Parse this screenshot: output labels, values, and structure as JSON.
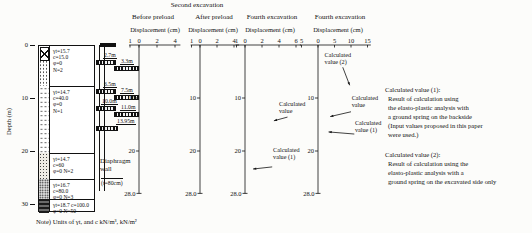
{
  "figure": {
    "group_header": "Second excavation",
    "note": "Note) Units of γt, and c kN/m³, kN/m²"
  },
  "depth_axis": {
    "label": "Depth (m)",
    "ticks": [
      "0",
      "10",
      "20",
      "30"
    ]
  },
  "soil": {
    "layers": [
      {
        "text": "γt=15.7\nc=15.0\nφ=0\nN=2"
      },
      {
        "text": "γt=14.7\nc=40.0\nφ=0\nN=1"
      },
      {
        "text": "γt=14.7\nc=60\nφ=0 N=2"
      },
      {
        "text": "γt=16.7\nc=80.0\nφ=0 N=3"
      },
      {
        "text": "γt=18.7 c=100.0\nφ=0 N=50"
      }
    ]
  },
  "wall": {
    "label": "Diaphragm\nwall",
    "thickness": "(t=80cm)",
    "struts": [
      {
        "label": "2.7m"
      },
      {
        "label": "3.3m"
      },
      {
        "label": "6.5m"
      },
      {
        "label": "7.5m"
      },
      {
        "label": "10.0m"
      },
      {
        "label": "11.0m"
      },
      {
        "label": "13.95m"
      }
    ]
  },
  "legend_notes": [
    {
      "title": "Calculated value (1):",
      "body": "Result of calculation using\nthe elasto-plastic analysis with\na ground spring on the backside\n(Input values proposed in this paper\nwere used.)"
    },
    {
      "title": "Calculated value (2):",
      "body": "Result of calculation using the\nelasto-plastic analysis with a\nground spring on the excavated side only"
    }
  ],
  "chart_data": [
    {
      "type": "line",
      "title": "Before preload",
      "xlabel": "Displacement (cm)",
      "x_ticks": [
        {
          "v": -1,
          "label": "1"
        },
        {
          "v": 0,
          "label": "0"
        },
        {
          "v": 2,
          "label": "2"
        },
        {
          "v": 4,
          "label": "4"
        }
      ],
      "x_range": [
        -1.1,
        4.6
      ],
      "depth_ticks": [
        {
          "v": 10,
          "label": "10"
        },
        {
          "v": 20,
          "label": "20"
        }
      ],
      "depth_max": 28,
      "bottom_label": "28.0",
      "series": [
        {
          "name": "measured",
          "style": "solid",
          "points": [
            [
              0,
              0.7
            ],
            [
              2,
              1.4
            ],
            [
              4,
              2.6
            ],
            [
              6,
              3.8
            ],
            [
              8,
              4.4
            ],
            [
              10,
              4.5
            ],
            [
              12,
              4.1
            ],
            [
              14,
              3.5
            ],
            [
              16,
              2.8
            ],
            [
              18,
              2.0
            ],
            [
              20,
              1.2
            ],
            [
              22,
              0.6
            ],
            [
              24,
              0.25
            ],
            [
              26,
              0.12
            ],
            [
              28,
              0.08
            ]
          ]
        },
        {
          "name": "calculated",
          "style": "dashed",
          "points": [
            [
              0,
              0.15
            ],
            [
              2,
              0.7
            ],
            [
              4,
              1.5
            ],
            [
              6,
              2.3
            ],
            [
              8,
              2.8
            ],
            [
              10,
              3.05
            ],
            [
              12,
              3.05
            ],
            [
              14,
              2.85
            ],
            [
              16,
              2.45
            ],
            [
              18,
              1.9
            ],
            [
              20,
              1.25
            ],
            [
              22,
              0.65
            ],
            [
              24,
              0.3
            ],
            [
              26,
              0.12
            ],
            [
              28,
              0.08
            ]
          ]
        }
      ]
    },
    {
      "type": "line",
      "title": "After preload",
      "xlabel": "Displacement (cm)",
      "x_ticks": [
        {
          "v": -1,
          "label": "1"
        },
        {
          "v": 0,
          "label": "0"
        },
        {
          "v": 2,
          "label": "2"
        },
        {
          "v": 4,
          "label": "4"
        }
      ],
      "x_range": [
        -1.1,
        4.6
      ],
      "depth_ticks": [
        {
          "v": 10,
          "label": "10"
        },
        {
          "v": 20,
          "label": "20"
        }
      ],
      "depth_max": 28,
      "bottom_label": "28.0",
      "series": [
        {
          "name": "measured",
          "style": "solid",
          "points": [
            [
              0,
              0.55
            ],
            [
              2,
              0.9
            ],
            [
              4,
              1.5
            ],
            [
              6,
              2.2
            ],
            [
              8,
              2.9
            ],
            [
              10,
              3.4
            ],
            [
              12,
              3.6
            ],
            [
              14,
              3.5
            ],
            [
              16,
              3.1
            ],
            [
              18,
              2.5
            ],
            [
              20,
              1.7
            ],
            [
              22,
              1.0
            ],
            [
              24,
              0.45
            ],
            [
              26,
              0.15
            ],
            [
              28,
              0.08
            ]
          ]
        },
        {
          "name": "calculated",
          "style": "dashed",
          "points": [
            [
              0,
              0.1
            ],
            [
              2,
              0.6
            ],
            [
              4,
              1.3
            ],
            [
              6,
              2.0
            ],
            [
              8,
              2.7
            ],
            [
              10,
              3.15
            ],
            [
              12,
              3.35
            ],
            [
              14,
              3.3
            ],
            [
              16,
              2.95
            ],
            [
              18,
              2.4
            ],
            [
              20,
              1.65
            ],
            [
              22,
              0.95
            ],
            [
              24,
              0.45
            ],
            [
              26,
              0.15
            ],
            [
              28,
              0.08
            ]
          ]
        }
      ]
    },
    {
      "type": "line",
      "title": "Fourth excavation",
      "xlabel": "Displacement (cm)",
      "x_ticks": [
        {
          "v": -1,
          "label": "1"
        },
        {
          "v": 0,
          "label": "0"
        },
        {
          "v": 2,
          "label": "2"
        },
        {
          "v": 4,
          "label": "4"
        },
        {
          "v": 6,
          "label": "6"
        }
      ],
      "x_range": [
        -1.1,
        6.6
      ],
      "depth_ticks": [
        {
          "v": 10,
          "label": "10"
        },
        {
          "v": 20,
          "label": "20"
        }
      ],
      "depth_max": 28,
      "bottom_label": "28.0",
      "series": [
        {
          "name": "measured",
          "style": "solid",
          "points": [
            [
              0,
              0.6
            ],
            [
              2,
              1.0
            ],
            [
              4,
              1.6
            ],
            [
              6,
              2.4
            ],
            [
              8,
              3.3
            ],
            [
              10,
              4.2
            ],
            [
              12,
              4.8
            ],
            [
              14,
              5.0
            ],
            [
              16,
              4.6
            ],
            [
              18,
              3.8
            ],
            [
              20,
              2.6
            ],
            [
              22,
              1.4
            ],
            [
              24,
              0.5
            ],
            [
              26,
              0.15
            ],
            [
              28,
              0.08
            ]
          ]
        },
        {
          "name": "calculated (1)",
          "style": "dashed",
          "points": [
            [
              0,
              0.1
            ],
            [
              2,
              0.6
            ],
            [
              4,
              1.2
            ],
            [
              6,
              1.9
            ],
            [
              8,
              2.6
            ],
            [
              10,
              3.1
            ],
            [
              12,
              3.4
            ],
            [
              14,
              3.4
            ],
            [
              16,
              3.1
            ],
            [
              18,
              2.6
            ],
            [
              20,
              1.9
            ],
            [
              22,
              1.15
            ],
            [
              24,
              0.45
            ],
            [
              26,
              0.15
            ],
            [
              28,
              0.08
            ]
          ]
        }
      ],
      "annotations": [
        {
          "lines": [
            "Calculated",
            "value"
          ],
          "label_cm": 4.0,
          "label_m": 11.5,
          "from_cm": 5.0,
          "from_m": 13.6,
          "to_cm": 3.4,
          "to_m": 14.3
        },
        {
          "lines": [
            "Calculated",
            "value (1)"
          ],
          "label_cm": 3.3,
          "label_m": 20.2,
          "from_cm": 3.2,
          "from_m": 23.0,
          "to_cm": 0.95,
          "to_m": 23.4
        }
      ]
    },
    {
      "type": "line",
      "title": "Fourth excavation",
      "xlabel": "Displacement (cm)",
      "x_ticks": [
        {
          "v": -5,
          "label": "5"
        },
        {
          "v": 0,
          "label": "0"
        },
        {
          "v": 5,
          "label": "5"
        },
        {
          "v": 10,
          "label": "10"
        },
        {
          "v": 15,
          "label": "15"
        }
      ],
      "x_range": [
        -5.5,
        16.0
      ],
      "depth_ticks": [
        {
          "v": 10,
          "label": "10"
        },
        {
          "v": 20,
          "label": "20"
        }
      ],
      "depth_max": 28,
      "bottom_label": "28.0",
      "series": [
        {
          "name": "measured",
          "style": "solid",
          "points": [
            [
              0,
              0.5
            ],
            [
              2,
              0.8
            ],
            [
              4,
              1.3
            ],
            [
              6,
              1.9
            ],
            [
              8,
              2.5
            ],
            [
              10,
              2.9
            ],
            [
              12,
              3.1
            ],
            [
              14,
              3.0
            ],
            [
              16,
              2.6
            ],
            [
              18,
              2.0
            ],
            [
              20,
              1.3
            ],
            [
              22,
              0.7
            ],
            [
              24,
              0.3
            ],
            [
              26,
              0.12
            ],
            [
              28,
              0.08
            ]
          ]
        },
        {
          "name": "calculated (1)",
          "style": "dashed",
          "points": [
            [
              0,
              0.15
            ],
            [
              2,
              0.7
            ],
            [
              4,
              1.4
            ],
            [
              6,
              2.2
            ],
            [
              8,
              2.9
            ],
            [
              10,
              3.4
            ],
            [
              12,
              3.6
            ],
            [
              14,
              3.5
            ],
            [
              16,
              3.1
            ],
            [
              18,
              2.4
            ],
            [
              20,
              1.6
            ],
            [
              22,
              0.9
            ],
            [
              24,
              0.35
            ],
            [
              26,
              0.12
            ],
            [
              28,
              0.08
            ]
          ]
        },
        {
          "name": "calculated (2)",
          "style": "dashdot",
          "points": [
            [
              0,
              0.5
            ],
            [
              2,
              2.6
            ],
            [
              4,
              5.2
            ],
            [
              6,
              7.6
            ],
            [
              8,
              9.4
            ],
            [
              10,
              10.5
            ],
            [
              12,
              10.2
            ],
            [
              14,
              8.8
            ],
            [
              16,
              6.6
            ],
            [
              18,
              4.4
            ],
            [
              20,
              2.6
            ],
            [
              22,
              1.4
            ],
            [
              24,
              0.7
            ],
            [
              26,
              0.3
            ],
            [
              28,
              0.1
            ]
          ]
        }
      ],
      "annotations": [
        {
          "lines": [
            "Calculated",
            "value (2)"
          ],
          "label_cm": 2.0,
          "label_m": 2.3,
          "from_cm": 7.5,
          "from_m": 4.2,
          "to_cm": 9.6,
          "to_m": 7.6
        },
        {
          "lines": [
            "Calculated",
            "value"
          ],
          "label_cm": 10.2,
          "label_m": 10.4,
          "from_cm": 10.0,
          "from_m": 12.6,
          "to_cm": 3.7,
          "to_m": 13.5
        },
        {
          "lines": [
            "Calculated",
            "value (1)"
          ],
          "label_cm": 11.2,
          "label_m": 15.1,
          "from_cm": 11.0,
          "from_m": 16.8,
          "to_cm": 3.2,
          "to_m": 16.4
        }
      ]
    }
  ]
}
